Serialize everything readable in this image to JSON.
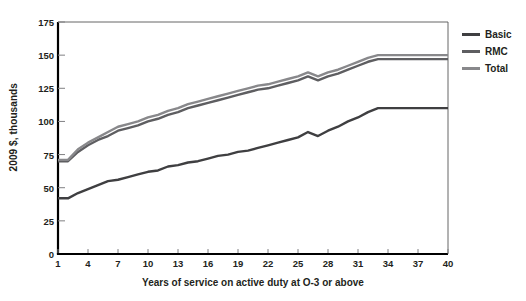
{
  "chart_data": {
    "type": "line",
    "title": "",
    "xlabel": "Years of service on active duty at O-3 or above",
    "ylabel": "2009 $, thousands",
    "xlim": [
      1,
      40
    ],
    "ylim": [
      0,
      175
    ],
    "ytick_values": [
      0,
      25,
      50,
      75,
      100,
      125,
      150,
      175
    ],
    "ytick_labels": [
      "0",
      "25",
      "50",
      "75",
      "100",
      "125",
      "150",
      "175"
    ],
    "xtick_values": [
      1,
      4,
      7,
      10,
      13,
      16,
      19,
      22,
      25,
      28,
      31,
      34,
      37,
      40
    ],
    "xtick_labels": [
      "1",
      "4",
      "7",
      "10",
      "13",
      "16",
      "19",
      "22",
      "25",
      "28",
      "31",
      "34",
      "37",
      "40"
    ],
    "grid": false,
    "legend_position": "right",
    "x": [
      1,
      2,
      3,
      4,
      5,
      6,
      7,
      8,
      9,
      10,
      11,
      12,
      13,
      14,
      15,
      16,
      17,
      18,
      19,
      20,
      21,
      22,
      23,
      24,
      25,
      26,
      27,
      28,
      29,
      30,
      31,
      32,
      33,
      34,
      35,
      36,
      37,
      38,
      39,
      40
    ],
    "series": [
      {
        "name": "Basic",
        "color": "#3f3f41",
        "values": [
          42,
          42,
          46,
          49,
          52,
          55,
          56,
          58,
          60,
          62,
          63,
          66,
          67,
          69,
          70,
          72,
          74,
          75,
          77,
          78,
          80,
          82,
          84,
          86,
          88,
          92,
          89,
          93,
          96,
          100,
          103,
          107,
          110,
          110,
          110,
          110,
          110,
          110,
          110,
          110
        ]
      },
      {
        "name": "RMC",
        "color": "#5e5e61",
        "values": [
          70,
          70,
          77,
          82,
          86,
          89,
          93,
          95,
          97,
          100,
          102,
          105,
          107,
          110,
          112,
          114,
          116,
          118,
          120,
          122,
          124,
          125,
          127,
          129,
          131,
          134,
          131,
          134,
          136,
          139,
          142,
          145,
          147,
          147,
          147,
          147,
          147,
          147,
          147,
          147
        ]
      },
      {
        "name": "Total",
        "color": "#88888b",
        "values": [
          71,
          71,
          79,
          84,
          88,
          92,
          96,
          98,
          100,
          103,
          105,
          108,
          110,
          113,
          115,
          117,
          119,
          121,
          123,
          125,
          127,
          128,
          130,
          132,
          134,
          137,
          134,
          137,
          139,
          142,
          145,
          148,
          150,
          150,
          150,
          150,
          150,
          150,
          150,
          150
        ]
      }
    ],
    "legend": [
      {
        "label": "Basic",
        "color": "#3f3f41"
      },
      {
        "label": "RMC",
        "color": "#5e5e61"
      },
      {
        "label": "Total",
        "color": "#88888b"
      }
    ],
    "axis": {
      "color": "#000000",
      "left_px": 58,
      "right_px": 448,
      "top_px": 22,
      "bottom_px": 254
    }
  }
}
